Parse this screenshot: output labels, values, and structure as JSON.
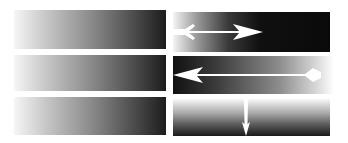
{
  "diagram": {
    "colors": {
      "background": "#ffffff",
      "gradient_light": "#f6f6f6",
      "gradient_dark": "#111111",
      "arrow": "#ffffff"
    },
    "left_column": [
      {
        "id": "left-1",
        "direction": "left-to-right",
        "from": "white",
        "to": "black"
      },
      {
        "id": "left-2",
        "direction": "left-to-right",
        "from": "white",
        "to": "black"
      },
      {
        "id": "left-3",
        "direction": "left-to-right",
        "from": "white",
        "to": "black"
      }
    ],
    "right_column": [
      {
        "id": "right-1",
        "direction": "left-to-right",
        "from": "white",
        "to": "black",
        "arrow": "right"
      },
      {
        "id": "right-2",
        "direction": "right-to-left",
        "from": "white",
        "to": "black",
        "arrow": "left"
      },
      {
        "id": "right-3",
        "direction": "top-to-bottom",
        "from": "white",
        "to": "black",
        "arrow": "down"
      }
    ]
  }
}
